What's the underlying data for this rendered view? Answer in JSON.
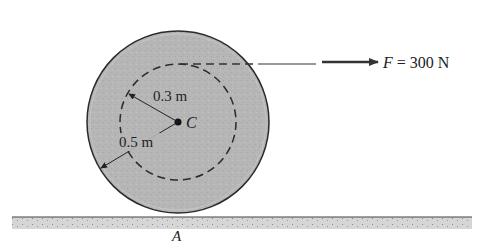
{
  "diagram": {
    "type": "rigid-body-wheel-on-ground",
    "colors": {
      "disk_fill": "#b4b4b4",
      "disk_stroke": "#2a2a2a",
      "ground_fill": "#d2d2d2",
      "line": "#333333",
      "text": "#222222"
    },
    "labels": {
      "inner_radius": "0.3 m",
      "outer_radius": "0.5 m",
      "center": "C",
      "contact_point": "A",
      "force_symbol": "F",
      "force_equals": " = 300 N"
    },
    "force": {
      "name": "F",
      "magnitude": 300,
      "unit": "N",
      "direction": "right"
    },
    "dimensions": {
      "outer_radius_m": 0.5,
      "inner_radius_m": 0.3
    }
  }
}
